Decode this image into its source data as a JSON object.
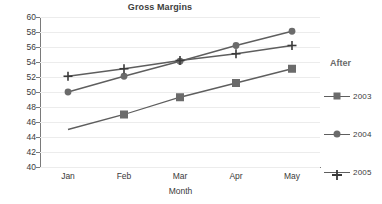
{
  "chart_data": {
    "type": "line",
    "title": "Gross Margins",
    "xlabel": "Month",
    "ylabel": "",
    "categories": [
      "Jan",
      "Feb",
      "Mar",
      "Apr",
      "May"
    ],
    "ylim": [
      40,
      60
    ],
    "yticks": [
      40,
      42,
      44,
      46,
      48,
      50,
      52,
      54,
      56,
      58,
      60
    ],
    "grid": true,
    "legend_position": "right",
    "legend_title": "After",
    "series": [
      {
        "name": "2003",
        "marker": "square",
        "color": "#6b6b6b",
        "values": [
          45.0,
          47.0,
          49.3,
          51.2,
          53.1
        ]
      },
      {
        "name": "2004",
        "marker": "circle",
        "color": "#6b6b6b",
        "values": [
          50.0,
          52.1,
          54.1,
          56.2,
          58.1
        ]
      },
      {
        "name": "2005",
        "marker": "plus",
        "color": "#3a3a3a",
        "values": [
          52.1,
          53.1,
          54.2,
          55.1,
          56.2
        ]
      }
    ]
  },
  "colors": {
    "background": "#ffffff",
    "gridline": "#ececec",
    "axis": "#7a7a7a",
    "text": "#3a3a3a",
    "title": "#404040",
    "legend_title": "#6a6a6a",
    "line": "#5e5e5e"
  }
}
